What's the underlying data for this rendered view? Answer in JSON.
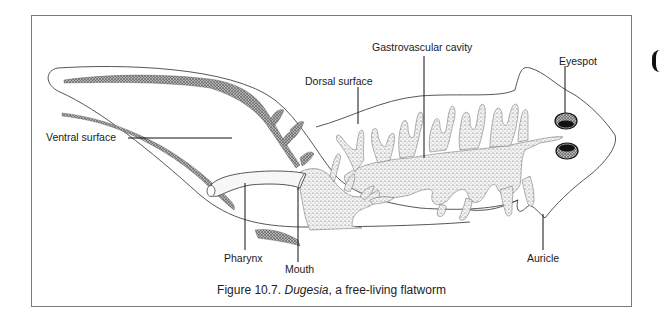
{
  "figure": {
    "caption_prefix": "Figure 10.7.",
    "caption_species": "Dugesia",
    "caption_suffix": ", a free-living flatworm"
  },
  "labels": {
    "gastrovascular_cavity": "Gastrovascular cavity",
    "eyespot": "Eyespot",
    "dorsal_surface": "Dorsal surface",
    "ventral_surface": "Ventral surface",
    "pharynx": "Pharynx",
    "mouth": "Mouth",
    "auricle": "Auricle"
  },
  "colors": {
    "outline": "#444444",
    "stipple": "#555555",
    "frame": "#7a7a7a",
    "text": "#1a1a1a"
  }
}
